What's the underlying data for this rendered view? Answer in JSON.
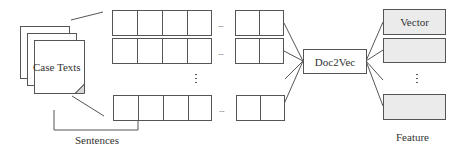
{
  "diagram": {
    "input": {
      "label": "Case Texts",
      "page_count": 3
    },
    "sentences": {
      "label": "Sentences",
      "rows": [
        {
          "left_cells": 4,
          "right_cells": 2,
          "ellipsis": "..."
        },
        {
          "left_cells": 4,
          "right_cells": 2,
          "ellipsis": "..."
        },
        {
          "left_cells": 4,
          "right_cells": 2,
          "ellipsis": "..."
        }
      ],
      "vertical_ellipsis": "⋮"
    },
    "model": {
      "label": "Doc2Vec"
    },
    "feature": {
      "label": "Feature",
      "vectors": [
        {
          "label": "Vector"
        },
        {
          "label": ""
        },
        {
          "label": ""
        }
      ],
      "vertical_ellipsis": "⋮"
    },
    "colors": {
      "stroke": "#555555",
      "vector_fill": "#ebebeb",
      "text": "#333333"
    }
  }
}
